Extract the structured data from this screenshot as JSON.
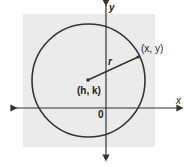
{
  "diagram": {
    "labels": {
      "y_axis": "y",
      "x_axis": "x",
      "origin": "0",
      "radius": "r",
      "center": "(h, k)",
      "point": "(x, y)"
    },
    "colors": {
      "background": "#ebebeb",
      "stroke": "#333333"
    }
  }
}
